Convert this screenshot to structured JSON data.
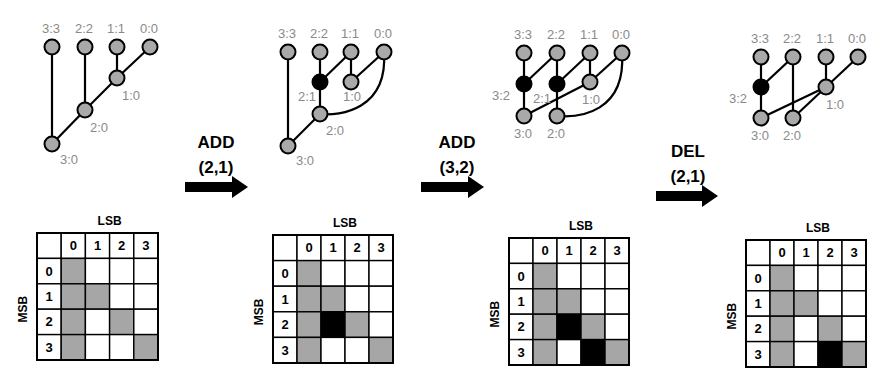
{
  "colors": {
    "node_fill": "#a9a9a9",
    "node_active": "#000000",
    "cell_gray": "#a6a6a6",
    "cell_black": "#000000",
    "cell_white": "#ffffff",
    "stroke": "#000000",
    "label": "#8a8a8a"
  },
  "operations": [
    {
      "op": "ADD",
      "arg": "(2,1)",
      "x": 216,
      "y_op": 148,
      "y_arg": 173,
      "arrow": {
        "x": 185,
        "y": 187,
        "len": 63
      }
    },
    {
      "op": "ADD",
      "arg": "(3,2)",
      "x": 457,
      "y_op": 148,
      "y_arg": 173,
      "arrow": {
        "x": 421,
        "y": 187,
        "len": 63
      }
    },
    {
      "op": "DEL",
      "arg": "(2,1)",
      "x": 688,
      "y_op": 157,
      "y_arg": 182,
      "arrow": {
        "x": 656,
        "y": 196,
        "len": 62
      }
    }
  ],
  "panels": [
    {
      "id": "initial",
      "tree": {
        "nodes": [
          {
            "id": "3:3",
            "x": 52,
            "y": 47,
            "lx": -10,
            "ly": -14,
            "active": false
          },
          {
            "id": "2:2",
            "x": 85,
            "y": 47,
            "lx": -10,
            "ly": -14,
            "active": false
          },
          {
            "id": "1:1",
            "x": 117,
            "y": 47,
            "lx": -10,
            "ly": -14,
            "active": false
          },
          {
            "id": "0:0",
            "x": 150,
            "y": 47,
            "lx": -10,
            "ly": -14,
            "active": false
          },
          {
            "id": "1:0",
            "x": 117,
            "y": 78,
            "lx": 5,
            "ly": 22,
            "active": false
          },
          {
            "id": "2:0",
            "x": 85,
            "y": 110,
            "lx": 5,
            "ly": 22,
            "active": false
          },
          {
            "id": "3:0",
            "x": 52,
            "y": 144,
            "lx": 8,
            "ly": 20,
            "active": false
          }
        ],
        "edges": [
          [
            "3:3",
            "3:0"
          ],
          [
            "2:2",
            "2:0"
          ],
          [
            "1:1",
            "1:0"
          ],
          [
            "0:0",
            "1:0"
          ],
          [
            "1:0",
            "2:0"
          ],
          [
            "2:0",
            "3:0"
          ]
        ],
        "curves": []
      },
      "grid": {
        "x": 37,
        "y": 233,
        "col_w": 24.2,
        "row_h": 25.4,
        "lsb_label": "LSB",
        "msb_label": "MSB",
        "col_headers": [
          "0",
          "1",
          "2",
          "3"
        ],
        "row_headers": [
          "0",
          "1",
          "2",
          "3"
        ],
        "cells": [
          [
            "G",
            "W",
            "W",
            "W"
          ],
          [
            "G",
            "G",
            "W",
            "W"
          ],
          [
            "G",
            "W",
            "G",
            "W"
          ],
          [
            "G",
            "W",
            "W",
            "G"
          ]
        ]
      }
    },
    {
      "id": "after-add-2-1",
      "tree": {
        "nodes": [
          {
            "id": "3:3",
            "x": 288,
            "y": 52,
            "lx": -10,
            "ly": -14,
            "active": false
          },
          {
            "id": "2:2",
            "x": 320,
            "y": 52,
            "lx": -10,
            "ly": -14,
            "active": false
          },
          {
            "id": "1:1",
            "x": 351,
            "y": 52,
            "lx": -10,
            "ly": -14,
            "active": false
          },
          {
            "id": "0:0",
            "x": 384,
            "y": 52,
            "lx": -10,
            "ly": -14,
            "active": false
          },
          {
            "id": "2:1",
            "x": 320,
            "y": 82,
            "lx": -22,
            "ly": 19,
            "active": true
          },
          {
            "id": "1:0",
            "x": 351,
            "y": 82,
            "lx": -8,
            "ly": 19,
            "active": false
          },
          {
            "id": "2:0",
            "x": 320,
            "y": 114,
            "lx": 6,
            "ly": 21,
            "active": false
          },
          {
            "id": "3:0",
            "x": 288,
            "y": 146,
            "lx": 8,
            "ly": 19,
            "active": false
          }
        ],
        "edges": [
          [
            "3:3",
            "3:0"
          ],
          [
            "2:2",
            "2:1"
          ],
          [
            "2:1",
            "2:0"
          ],
          [
            "2:1",
            "1:1"
          ],
          [
            "1:1",
            "1:0"
          ],
          [
            "1:0",
            "0:0"
          ],
          [
            "2:0",
            "3:0"
          ]
        ],
        "curves": [
          {
            "from": "0:0",
            "to": "2:0",
            "c1": [
              388,
              110
            ],
            "c2": [
              340,
              116
            ]
          }
        ]
      },
      "grid": {
        "x": 273,
        "y": 235,
        "col_w": 24,
        "row_h": 25.6,
        "lsb_label": "LSB",
        "msb_label": "MSB",
        "col_headers": [
          "0",
          "1",
          "2",
          "3"
        ],
        "row_headers": [
          "0",
          "1",
          "2",
          "3"
        ],
        "cells": [
          [
            "G",
            "W",
            "W",
            "W"
          ],
          [
            "G",
            "G",
            "W",
            "W"
          ],
          [
            "G",
            "B",
            "G",
            "W"
          ],
          [
            "G",
            "W",
            "W",
            "G"
          ]
        ]
      }
    },
    {
      "id": "after-add-3-2",
      "tree": {
        "nodes": [
          {
            "id": "3:3",
            "x": 524,
            "y": 53,
            "lx": -10,
            "ly": -14,
            "active": false
          },
          {
            "id": "2:2",
            "x": 557,
            "y": 53,
            "lx": -10,
            "ly": -14,
            "active": false
          },
          {
            "id": "1:1",
            "x": 590,
            "y": 53,
            "lx": -10,
            "ly": -14,
            "active": false
          },
          {
            "id": "0:0",
            "x": 622,
            "y": 53,
            "lx": -10,
            "ly": -14,
            "active": false
          },
          {
            "id": "3:2",
            "x": 524,
            "y": 84,
            "lx": -32,
            "ly": 16,
            "active": true
          },
          {
            "id": "2:1",
            "x": 557,
            "y": 84,
            "lx": -24,
            "ly": 19,
            "active": false,
            "black": true
          },
          {
            "id": "1:0",
            "x": 590,
            "y": 82,
            "lx": -8,
            "ly": 22,
            "active": false
          },
          {
            "id": "3:0",
            "x": 524,
            "y": 116,
            "lx": -10,
            "ly": 22,
            "active": false
          },
          {
            "id": "2:0",
            "x": 557,
            "y": 116,
            "lx": -10,
            "ly": 22,
            "active": false
          }
        ],
        "edges": [
          [
            "3:3",
            "3:2"
          ],
          [
            "3:2",
            "3:0"
          ],
          [
            "3:2",
            "2:2"
          ],
          [
            "2:2",
            "2:1"
          ],
          [
            "2:1",
            "2:0"
          ],
          [
            "2:1",
            "1:1"
          ],
          [
            "1:1",
            "1:0"
          ],
          [
            "1:0",
            "0:0"
          ],
          [
            "1:0",
            "3:0"
          ]
        ],
        "curves": [
          {
            "from": "0:0",
            "to": "2:0",
            "c1": [
              626,
              112
            ],
            "c2": [
              580,
              118
            ]
          }
        ]
      },
      "grid": {
        "x": 509,
        "y": 238,
        "col_w": 24,
        "row_h": 25.4,
        "lsb_label": "LSB",
        "msb_label": "MSB",
        "col_headers": [
          "0",
          "1",
          "2",
          "3"
        ],
        "row_headers": [
          "0",
          "1",
          "2",
          "3"
        ],
        "cells": [
          [
            "G",
            "W",
            "W",
            "W"
          ],
          [
            "G",
            "G",
            "W",
            "W"
          ],
          [
            "G",
            "B",
            "G",
            "W"
          ],
          [
            "G",
            "W",
            "B",
            "G"
          ]
        ]
      }
    },
    {
      "id": "after-del-2-1",
      "tree": {
        "nodes": [
          {
            "id": "3:3",
            "x": 761,
            "y": 57,
            "lx": -10,
            "ly": -14,
            "active": false
          },
          {
            "id": "2:2",
            "x": 793,
            "y": 57,
            "lx": -10,
            "ly": -14,
            "active": false
          },
          {
            "id": "1:1",
            "x": 826,
            "y": 57,
            "lx": -10,
            "ly": -14,
            "active": false
          },
          {
            "id": "0:0",
            "x": 858,
            "y": 57,
            "lx": -10,
            "ly": -14,
            "active": false
          },
          {
            "id": "3:2",
            "x": 761,
            "y": 87,
            "lx": -32,
            "ly": 16,
            "active": true
          },
          {
            "id": "1:0",
            "x": 826,
            "y": 87,
            "lx": 0,
            "ly": 22,
            "active": false
          },
          {
            "id": "3:0",
            "x": 761,
            "y": 118,
            "lx": -10,
            "ly": 22,
            "active": false
          },
          {
            "id": "2:0",
            "x": 793,
            "y": 118,
            "lx": -10,
            "ly": 22,
            "active": false
          }
        ],
        "edges": [
          [
            "3:3",
            "3:2"
          ],
          [
            "3:2",
            "3:0"
          ],
          [
            "3:2",
            "2:2"
          ],
          [
            "2:2",
            "2:0"
          ],
          [
            "1:1",
            "1:0"
          ],
          [
            "1:0",
            "0:0"
          ],
          [
            "1:0",
            "3:0"
          ],
          [
            "1:0",
            "2:0"
          ]
        ],
        "curves": []
      },
      "grid": {
        "x": 746,
        "y": 240,
        "col_w": 24,
        "row_h": 25.4,
        "lsb_label": "LSB",
        "msb_label": "MSB",
        "col_headers": [
          "0",
          "1",
          "2",
          "3"
        ],
        "row_headers": [
          "0",
          "1",
          "2",
          "3"
        ],
        "cells": [
          [
            "G",
            "W",
            "W",
            "W"
          ],
          [
            "G",
            "G",
            "W",
            "W"
          ],
          [
            "G",
            "W",
            "G",
            "W"
          ],
          [
            "G",
            "W",
            "B",
            "G"
          ]
        ]
      }
    }
  ]
}
